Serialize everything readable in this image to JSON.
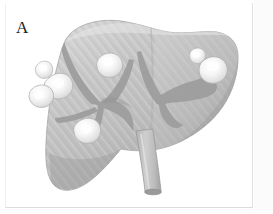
{
  "figure": {
    "panel_label": "A",
    "modality": "grayscale-medical-illustration",
    "background_color": "#ffffff",
    "frame_color": "#e2e2e2"
  },
  "organ": {
    "name": "liver",
    "fill_light": "#cfcfcf",
    "fill_mid": "#bdbdbd",
    "fill_dark": "#a8a8a8",
    "outline_color": "#9a9a9a",
    "texture": "diagonal-striations",
    "lobes": [
      {
        "name": "right-lobe",
        "position": "left-of-image"
      },
      {
        "name": "left-lobe",
        "position": "right-of-image"
      }
    ]
  },
  "vessels": {
    "color": "#9d9d9d",
    "items": [
      {
        "name": "left-hepatic-vein-branch"
      },
      {
        "name": "middle-hepatic-vein-branch"
      },
      {
        "name": "portal-vein-branch"
      },
      {
        "name": "right-hepatic-vein-branch"
      },
      {
        "name": "right-portal-branch"
      }
    ]
  },
  "duct": {
    "name": "common-bile-duct",
    "color": "#c0c0c0",
    "outline_color": "#9a9a9a"
  },
  "lesions": {
    "label": "metastatic-nodules",
    "count": 6,
    "fill_color": "#f2f2f2",
    "highlight_color": "#ffffff",
    "rim_color": "#b6b6b6",
    "items": [
      {
        "id": "lesion-1",
        "region": "right-lobe-superior-lateral",
        "size": "small"
      },
      {
        "id": "lesion-2",
        "region": "right-lobe-lateral-mid",
        "size": "large"
      },
      {
        "id": "lesion-3",
        "region": "right-lobe-lateral-inferior",
        "size": "medium"
      },
      {
        "id": "lesion-4",
        "region": "right-lobe-superior-medial",
        "size": "medium"
      },
      {
        "id": "lesion-5",
        "region": "right-lobe-inferior-medial",
        "size": "medium"
      },
      {
        "id": "lesion-6",
        "region": "left-lobe-superior",
        "size": "small"
      },
      {
        "id": "lesion-7",
        "region": "left-lobe-lateral",
        "size": "large"
      }
    ]
  }
}
